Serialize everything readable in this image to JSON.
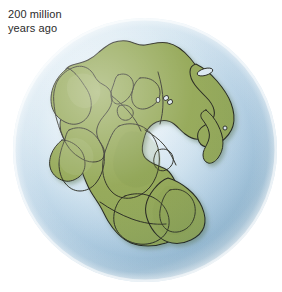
{
  "figure": {
    "kind": "paleogeographic-globe-illustration",
    "background_color": "#ffffff"
  },
  "caption": {
    "line1": "200 million",
    "line2": "years ago",
    "text": "200 million\nyears ago",
    "color": "#2b2b2b"
  },
  "globe": {
    "center_x": 145,
    "center_y": 150,
    "radius": 132,
    "ocean_color_light": "#eff5fa",
    "ocean_color_mid": "#c4dcec",
    "ocean_color_deep": "#9dc0d9",
    "rim_highlight_color": "#f3f8fc",
    "shadow_color": "#7fa7c4"
  },
  "landmass": {
    "name": "Pangaea",
    "fill_color": "#8fa44f",
    "fill_color_light": "#9fb165",
    "fill_color_shaded": "#849a4a",
    "outline_color": "#1c1c14",
    "outline_width": 1.0,
    "drop_shadow_color": "#6f8c68"
  },
  "features": {
    "tethys_sea_label": "Tethys Sea inlet",
    "island_count": 5
  }
}
